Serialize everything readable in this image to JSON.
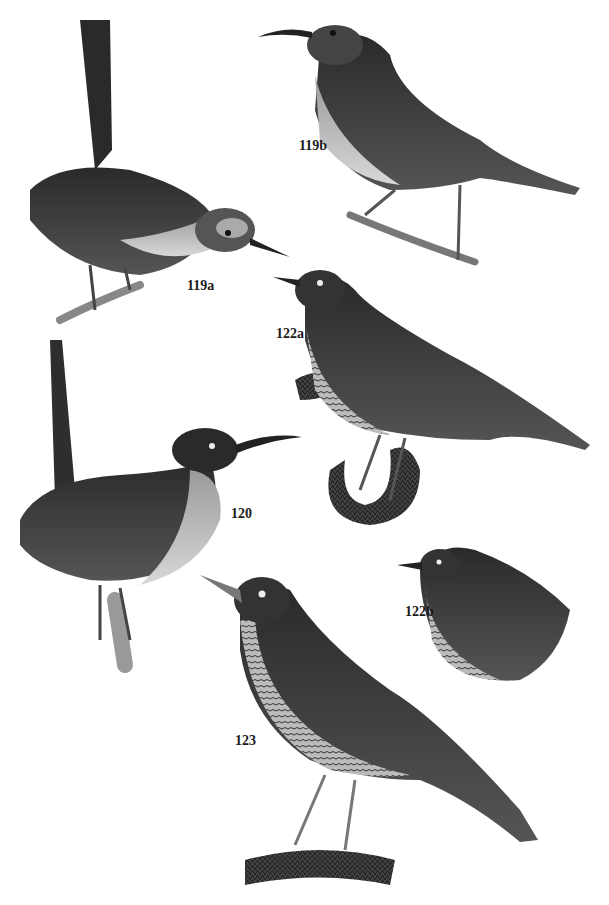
{
  "plate": {
    "background": "#ffffff",
    "ink": "#1a1a1a",
    "figures": [
      {
        "id": "119a",
        "label": "119a",
        "subject": "wren with cocked tail perched on twig"
      },
      {
        "id": "119b",
        "label": "119b",
        "subject": "long-billed bird perched on branch"
      },
      {
        "id": "122a",
        "label": "122a",
        "subject": "scaly-breasted bird on mossy branch"
      },
      {
        "id": "120",
        "label": "120",
        "subject": "long-billed wren with upright tail on branch"
      },
      {
        "id": "122b",
        "label": "122b",
        "subject": "scaly-breasted bird, head and upper body"
      },
      {
        "id": "123",
        "label": "123",
        "subject": "thrush-like bird standing on mossy log"
      }
    ]
  }
}
